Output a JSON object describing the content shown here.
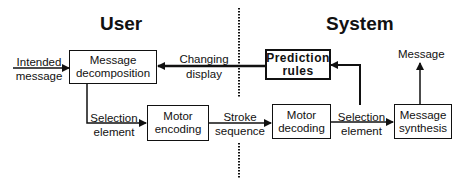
{
  "sections": {
    "user": "User",
    "system": "System"
  },
  "boxes": {
    "message_decomposition": {
      "line1": "Message",
      "line2": "decomposition"
    },
    "motor_encoding": {
      "line1": "Motor",
      "line2": "encoding"
    },
    "prediction_rules": {
      "line1": "Prediction",
      "line2": "rules"
    },
    "motor_decoding": {
      "line1": "Motor",
      "line2": "decoding"
    },
    "message_synthesis": {
      "line1": "Message",
      "line2": "synthesis"
    }
  },
  "edges": {
    "intended_message": {
      "line1": "Intended",
      "line2": "message"
    },
    "changing_display": {
      "line1": "Changing",
      "line2": "display"
    },
    "selection_element_user": {
      "line1": "Selection",
      "line2": "element"
    },
    "stroke_sequence": {
      "line1": "Stroke",
      "line2": "sequence"
    },
    "selection_element_system": {
      "line1": "Selection",
      "line2": "element"
    },
    "message_output": {
      "line1": "Message"
    }
  },
  "colors": {
    "ink": "#111111",
    "background": "#ffffff"
  }
}
